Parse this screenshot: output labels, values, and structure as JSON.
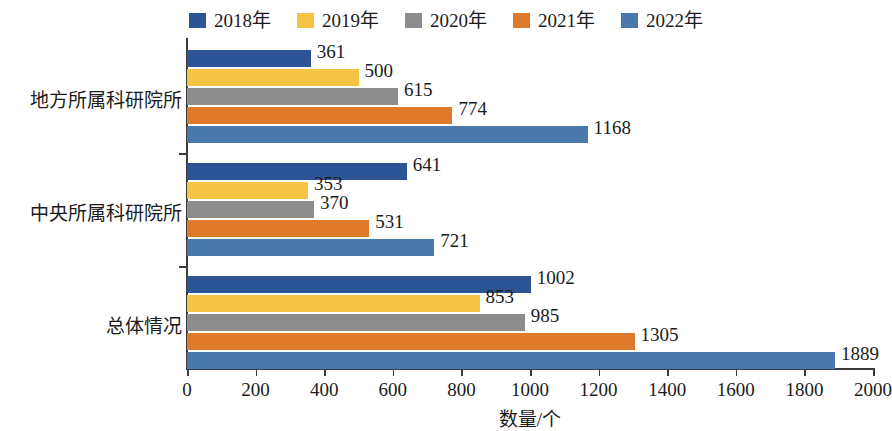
{
  "chart_data": {
    "type": "bar",
    "orientation": "horizontal",
    "title": "",
    "xlabel": "数量/个",
    "ylabel": "",
    "xlim": [
      0,
      2000
    ],
    "xticks": [
      0,
      200,
      400,
      600,
      800,
      1000,
      1200,
      1400,
      1600,
      1800,
      2000
    ],
    "grid": false,
    "legend_position": "top",
    "categories": [
      "地方所属科研院所",
      "中央所属科研院所",
      "总体情况"
    ],
    "series": [
      {
        "name": "2018年",
        "color": "#2d5596",
        "values": [
          361,
          641,
          1002
        ]
      },
      {
        "name": "2019年",
        "color": "#f6c445",
        "values": [
          500,
          353,
          853
        ]
      },
      {
        "name": "2020年",
        "color": "#8d8d8d",
        "values": [
          615,
          370,
          985
        ]
      },
      {
        "name": "2021年",
        "color": "#e07a2b",
        "values": [
          774,
          531,
          1305
        ]
      },
      {
        "name": "2022年",
        "color": "#4a78ad",
        "values": [
          1168,
          721,
          1889
        ]
      }
    ]
  },
  "legend": {
    "items": [
      {
        "label": "2018年",
        "color": "#2d5596"
      },
      {
        "label": "2019年",
        "color": "#f6c445"
      },
      {
        "label": "2020年",
        "color": "#8d8d8d"
      },
      {
        "label": "2021年",
        "color": "#e07a2b"
      },
      {
        "label": "2022年",
        "color": "#4a78ad"
      }
    ]
  },
  "axis": {
    "x_title": "数量/个",
    "x_tick_labels": [
      "0",
      "200",
      "400",
      "600",
      "800",
      "1000",
      "1200",
      "1400",
      "1600",
      "1800",
      "2000"
    ]
  }
}
